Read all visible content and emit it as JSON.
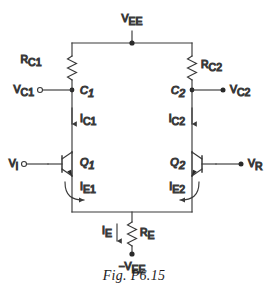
{
  "figure": {
    "caption": "Fig. P6.15",
    "type": "circuit-schematic"
  },
  "supplies": {
    "top_rail_label": "V",
    "top_rail_sub": "EE",
    "bottom_rail_label": "−V",
    "bottom_rail_sub": "EE"
  },
  "components": {
    "resistors": [
      {
        "name": "R",
        "sub": "C1",
        "id": "resistor-rc1"
      },
      {
        "name": "R",
        "sub": "C2",
        "id": "resistor-rc2"
      },
      {
        "name": "R",
        "sub": "E",
        "id": "resistor-re"
      }
    ],
    "transistors": [
      {
        "name": "Q",
        "sub": "1",
        "id": "transistor-q1",
        "device": "npn"
      },
      {
        "name": "Q",
        "sub": "2",
        "id": "transistor-q2",
        "device": "npn"
      }
    ]
  },
  "nodes": [
    {
      "name": "C",
      "sub": "1",
      "id": "node-c1"
    },
    {
      "name": "C",
      "sub": "2",
      "id": "node-c2"
    }
  ],
  "terminals": [
    {
      "name": "V",
      "sub": "C1",
      "id": "terminal-vc1",
      "marker": "open-circle",
      "side": "left"
    },
    {
      "name": "V",
      "sub": "C2",
      "id": "terminal-vc2",
      "marker": "filled-dot",
      "side": "right"
    },
    {
      "name": "V",
      "sub": "i",
      "id": "terminal-vi",
      "marker": "open-circle",
      "side": "left"
    },
    {
      "name": "V",
      "sub": "R",
      "id": "terminal-vr",
      "marker": "filled-dot",
      "side": "right"
    }
  ],
  "currents": [
    {
      "name": "I",
      "sub": "C1",
      "id": "current-ic1",
      "direction": "down",
      "arrow": "straight"
    },
    {
      "name": "I",
      "sub": "C2",
      "id": "current-ic2",
      "direction": "down",
      "arrow": "straight"
    },
    {
      "name": "I",
      "sub": "E1",
      "id": "current-ie1",
      "direction": "down-right",
      "arrow": "curved"
    },
    {
      "name": "I",
      "sub": "E2",
      "id": "current-ie2",
      "direction": "down-left",
      "arrow": "curved"
    },
    {
      "name": "I",
      "sub": "E",
      "id": "current-ie",
      "direction": "down",
      "arrow": "straight"
    }
  ],
  "colors": {
    "wire": "#3a3a3a",
    "text": "#2a2a2a",
    "caption": "#1d1d1d",
    "background": "#ffffff"
  }
}
